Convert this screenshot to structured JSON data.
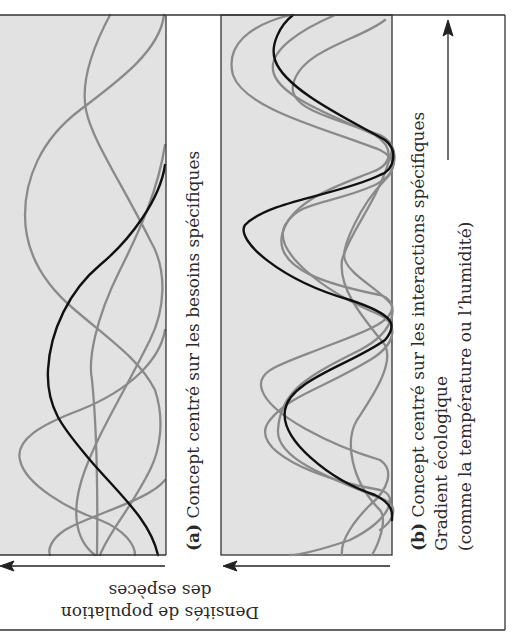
{
  "figure": {
    "orientation": "rotated-90-clockwise",
    "background_color": "#ffffff",
    "panel_fill": "#e2e2e2",
    "frame_color": "#333333",
    "focal_curve_color": "#111111",
    "other_curve_color": "#8a8a8a"
  },
  "panel_a": {
    "label": "(a)",
    "caption": "Concept centré sur les besoins spécifiques",
    "description": "Individualistic species distributions: curves peak at independent positions along the gradient"
  },
  "panel_b": {
    "label": "(b)",
    "caption": "Concept centré sur les interactions spécifiques",
    "description": "Interactive species distributions: curves aligned/co-varying along the gradient"
  },
  "axes": {
    "x_label": "Gradient écologique",
    "x_label_sub": "(comme la température ou l’humidité)",
    "y_label_line1": "Densités de population",
    "y_label_line2": "des espèces"
  }
}
